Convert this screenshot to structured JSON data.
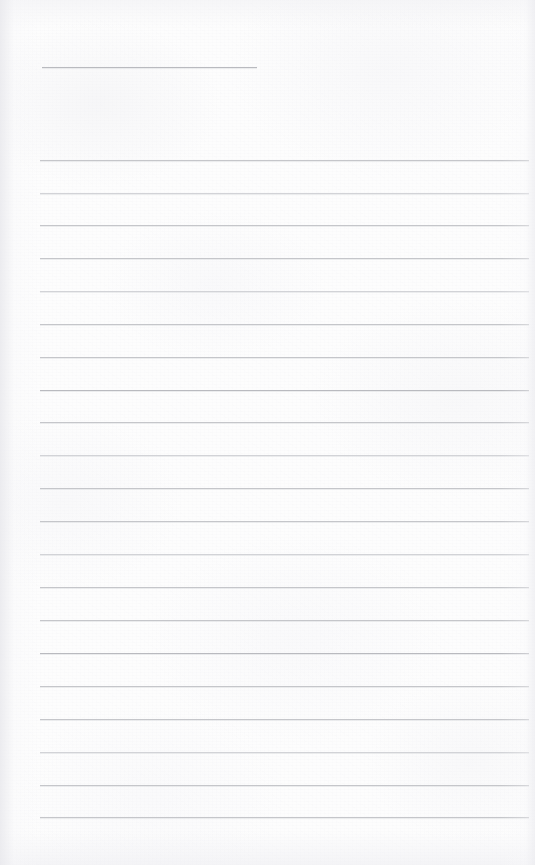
{
  "page": {
    "kind": "lined-notepad-page",
    "width": 535,
    "height": 865,
    "background_color": "#fdfdfd",
    "rule_color": "#c5c6ca",
    "rule_color_soft": "#d2d3d7",
    "rule_color_strong": "#b9babf",
    "content_text": "",
    "note": ""
  },
  "title_rule": {
    "name": "title-rule",
    "x": 42,
    "y": 67,
    "width": 215,
    "weight": "strong"
  },
  "body_rules": [
    {
      "y": 160,
      "x": 40,
      "width": 489,
      "weight": "normal"
    },
    {
      "y": 193,
      "x": 40,
      "width": 489,
      "weight": "soft"
    },
    {
      "y": 225,
      "x": 40,
      "width": 489,
      "weight": "normal"
    },
    {
      "y": 258,
      "x": 40,
      "width": 489,
      "weight": "normal"
    },
    {
      "y": 291,
      "x": 40,
      "width": 489,
      "weight": "soft"
    },
    {
      "y": 324,
      "x": 40,
      "width": 489,
      "weight": "normal"
    },
    {
      "y": 357,
      "x": 40,
      "width": 489,
      "weight": "normal"
    },
    {
      "y": 390,
      "x": 40,
      "width": 489,
      "weight": "strong"
    },
    {
      "y": 422,
      "x": 40,
      "width": 489,
      "weight": "normal"
    },
    {
      "y": 455,
      "x": 40,
      "width": 489,
      "weight": "soft"
    },
    {
      "y": 488,
      "x": 40,
      "width": 489,
      "weight": "normal"
    },
    {
      "y": 521,
      "x": 40,
      "width": 489,
      "weight": "normal"
    },
    {
      "y": 554,
      "x": 40,
      "width": 489,
      "weight": "soft"
    },
    {
      "y": 587,
      "x": 40,
      "width": 489,
      "weight": "normal"
    },
    {
      "y": 620,
      "x": 40,
      "width": 489,
      "weight": "normal"
    },
    {
      "y": 653,
      "x": 40,
      "width": 489,
      "weight": "strong"
    },
    {
      "y": 686,
      "x": 40,
      "width": 489,
      "weight": "normal"
    },
    {
      "y": 719,
      "x": 40,
      "width": 489,
      "weight": "normal"
    },
    {
      "y": 752,
      "x": 40,
      "width": 489,
      "weight": "soft"
    },
    {
      "y": 785,
      "x": 40,
      "width": 489,
      "weight": "normal"
    },
    {
      "y": 817,
      "x": 40,
      "width": 489,
      "weight": "normal"
    }
  ]
}
